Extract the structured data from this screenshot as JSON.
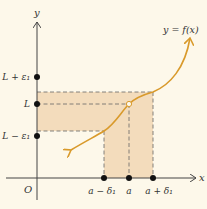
{
  "colors": {
    "background": "#fdf8ea",
    "shade": "#f3dcbc",
    "curve": "#d99a2b",
    "axis": "#444444",
    "dashed": "#666666",
    "dot": "#111111"
  },
  "axes": {
    "x_label": "x",
    "y_label": "y",
    "origin_label": "O"
  },
  "curve_label": "y = f(x)",
  "y_ticks": [
    {
      "label": "L + ε₁",
      "y": 77
    },
    {
      "label": "L",
      "y": 104
    },
    {
      "label": "L − ε₁",
      "y": 136
    }
  ],
  "x_ticks": [
    {
      "label": "a − δ₁",
      "x": 104
    },
    {
      "label": "a",
      "x": 129
    },
    {
      "label": "a + δ₁",
      "x": 153
    }
  ],
  "bands": {
    "horizontal": {
      "y_top": 92,
      "y_bottom": 131,
      "x_left": 37,
      "x_right": 153
    },
    "vertical": {
      "x_left": 104,
      "x_right": 153,
      "y_top": 92,
      "y_bottom": 178
    }
  },
  "hole_point": {
    "x": 129,
    "y": 104
  }
}
